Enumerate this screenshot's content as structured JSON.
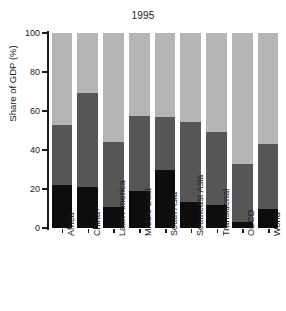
{
  "chart_data": {
    "type": "bar",
    "subtype": "stacked-bar-100",
    "title": "1995",
    "xlabel": "",
    "ylabel": "Share of GDP (%)",
    "ylim": [
      0,
      100
    ],
    "yticks": [
      0,
      20,
      40,
      60,
      80,
      100
    ],
    "grid": false,
    "legend": "none",
    "categories": [
      "Africa",
      "China+",
      "Latin America",
      "Middle East",
      "South Asia",
      "Southeast Asia",
      "Transitional",
      "OECD",
      "World"
    ],
    "series": [
      {
        "name": "Agriculture",
        "color": "#0d0d0d",
        "values": [
          22,
          21,
          11,
          19,
          30,
          13.5,
          12,
          3,
          10
        ]
      },
      {
        "name": "Industry",
        "color": "#565656",
        "values": [
          31,
          48,
          33,
          38.5,
          27,
          41,
          37,
          30,
          33
        ]
      },
      {
        "name": "Services",
        "color": "#b5b5b5",
        "values": [
          47,
          31,
          56,
          42.5,
          43,
          45.5,
          51,
          67,
          57
        ]
      }
    ],
    "cumulative_tops": {
      "segment1_top": [
        22,
        21,
        11,
        19,
        30,
        13.5,
        12,
        3,
        10
      ],
      "segment2_top": [
        53,
        69,
        44,
        57.5,
        57,
        54.5,
        49,
        33,
        43
      ],
      "segment3_top": [
        100,
        100,
        100,
        100,
        100,
        100,
        100,
        100,
        100
      ]
    }
  },
  "tick_labels": [
    "100",
    "80",
    "60",
    "40",
    "20",
    "0"
  ]
}
